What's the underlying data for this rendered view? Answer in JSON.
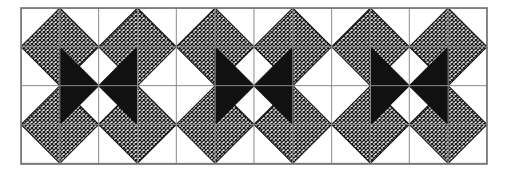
{
  "figure": {
    "kind": "quilt-block-diagram",
    "title": "",
    "caption": "",
    "canvas": {
      "width": 509,
      "height": 174,
      "background": "#ffffff"
    }
  },
  "frame": {
    "name": "outer-border",
    "x": 21,
    "y": 8,
    "width": 466,
    "height": 156,
    "stroke": "#6f6f6f",
    "stroke_width": 1.6,
    "fill": "#ffffff"
  },
  "grid": {
    "columns": 12,
    "rows": 4,
    "cell_size": 38.83,
    "line_color": "#8a8a8a",
    "line_width": 1,
    "visible": true
  },
  "palette": {
    "background": "#ffffff",
    "dark_fill": "#111111",
    "hatch_ink": "#1a1a1a",
    "hatch_ground": "#ffffff",
    "grid_line": "#8a8a8a",
    "frame_line": "#6f6f6f",
    "patch_outline": "#141414"
  },
  "hatch": {
    "name": "cross-hatch-fill",
    "type": "diagonal-cross-hatch",
    "tile_px": 4,
    "ink": "#1a1a1a",
    "ground": "#ffffff"
  },
  "blocks": [
    {
      "index": 1,
      "name": "star-block-1",
      "origin_col": 0,
      "rows": 4,
      "cols": 4
    },
    {
      "index": 2,
      "name": "star-block-2",
      "origin_col": 4,
      "rows": 4,
      "cols": 4
    },
    {
      "index": 3,
      "name": "star-block-3",
      "origin_col": 8,
      "rows": 4,
      "cols": 4
    }
  ],
  "block_template": {
    "name": "hatched-star-with-black-bowtie",
    "unit_cells": 4,
    "patches": [
      {
        "name": "hatched-diamond-top-left",
        "fill": "hatch",
        "center_cell": [
          1,
          1
        ]
      },
      {
        "name": "hatched-diamond-top-right",
        "fill": "hatch",
        "center_cell": [
          3,
          1
        ]
      },
      {
        "name": "hatched-diamond-bottom-left",
        "fill": "hatch",
        "center_cell": [
          1,
          3
        ]
      },
      {
        "name": "hatched-diamond-bottom-right",
        "fill": "hatch",
        "center_cell": [
          3,
          3
        ]
      },
      {
        "name": "black-triangle-left",
        "fill": "dark"
      },
      {
        "name": "black-triangle-right",
        "fill": "dark"
      },
      {
        "name": "white-triangle-top",
        "fill": "background"
      },
      {
        "name": "white-triangle-bottom",
        "fill": "background"
      }
    ]
  },
  "labels": {
    "figure_label": "",
    "notes": ""
  }
}
